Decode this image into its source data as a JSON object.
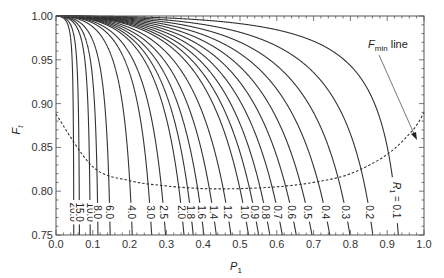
{
  "chart_data": {
    "type": "line",
    "title": "",
    "xlabel": "P1",
    "ylabel": "Ft",
    "xlim": [
      0.0,
      1.0
    ],
    "ylim": [
      0.75,
      1.0
    ],
    "xticks": [
      "0.0",
      "0.1",
      "0.2",
      "0.3",
      "0.4",
      "0.5",
      "0.6",
      "0.7",
      "0.8",
      "0.9",
      "1.0"
    ],
    "yticks": [
      "0.75",
      "0.80",
      "0.85",
      "0.90",
      "0.95",
      "1.00"
    ],
    "grid": false,
    "legend": null,
    "series_param_name": "R1",
    "series": [
      {
        "name": "20.0",
        "R": 20.0
      },
      {
        "name": "15.0",
        "R": 15.0
      },
      {
        "name": "10.0",
        "R": 10.0
      },
      {
        "name": "8.0",
        "R": 8.0
      },
      {
        "name": "6.0",
        "R": 6.0
      },
      {
        "name": "4.0",
        "R": 4.0
      },
      {
        "name": "3.0",
        "R": 3.0
      },
      {
        "name": "2.5",
        "R": 2.5
      },
      {
        "name": "2.0",
        "R": 2.0
      },
      {
        "name": "1.8",
        "R": 1.8
      },
      {
        "name": "1.6",
        "R": 1.6
      },
      {
        "name": "1.4",
        "R": 1.4
      },
      {
        "name": "1.2",
        "R": 1.2
      },
      {
        "name": "1.0",
        "R": 1.0
      },
      {
        "name": "0.9",
        "R": 0.9
      },
      {
        "name": "0.8",
        "R": 0.8
      },
      {
        "name": "0.7",
        "R": 0.7
      },
      {
        "name": "0.6",
        "R": 0.6
      },
      {
        "name": "0.5",
        "R": 0.5
      },
      {
        "name": "0.4",
        "R": 0.4
      },
      {
        "name": "0.3",
        "R": 0.3
      },
      {
        "name": "0.2",
        "R": 0.2
      },
      {
        "name": "0.1",
        "R": 0.1
      }
    ],
    "fmin_line": {
      "label": "Fmin line",
      "style": "dashed",
      "approx_points": [
        [
          0.0,
          0.888
        ],
        [
          0.1,
          0.828
        ],
        [
          0.2,
          0.812
        ],
        [
          0.3,
          0.806
        ],
        [
          0.4,
          0.803
        ],
        [
          0.5,
          0.803
        ],
        [
          0.6,
          0.805
        ],
        [
          0.7,
          0.81
        ],
        [
          0.8,
          0.82
        ],
        [
          0.9,
          0.842
        ],
        [
          0.97,
          0.87
        ],
        [
          1.0,
          0.89
        ]
      ]
    },
    "annotations": [
      "Fmin line",
      "R1 = 0.1"
    ]
  },
  "labels": {
    "y_axis": "F",
    "y_axis_sub": "t",
    "x_axis": "P",
    "x_axis_sub": "1",
    "fmin_main": "F",
    "fmin_sub": "min",
    "fmin_rest": " line",
    "r_prefix": "R",
    "r_sub": "1",
    "r_eq": " = 0.1"
  }
}
